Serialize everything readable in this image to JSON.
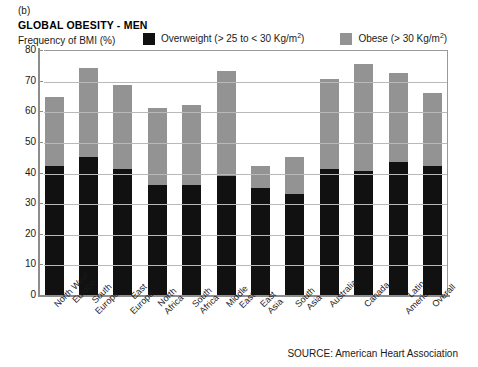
{
  "panel_label": "(b)",
  "title": "GLOBAL OBESITY - MEN",
  "axis_caption": "Frequency of BMI (%)",
  "source": "SOURCE: American Heart Association",
  "legend": [
    {
      "name": "legend-overweight",
      "label_pre": "Overweight (> 25 to < 30 Kg/m",
      "label_sup": "2",
      "label_post": ")",
      "color": "#111111"
    },
    {
      "name": "legend-obese",
      "label_pre": "Obese (> 30 Kg/m",
      "label_sup": "2",
      "label_post": ")",
      "color": "#939393"
    }
  ],
  "chart_data": {
    "type": "bar",
    "subtype": "stacked-vertical",
    "title": "GLOBAL OBESITY - MEN",
    "xlabel": "",
    "ylabel": "Frequency of BMI (%)",
    "ylim": [
      0,
      80
    ],
    "yticks": [
      0,
      10,
      20,
      30,
      40,
      50,
      60,
      70,
      80
    ],
    "grid": true,
    "legend_position": "top",
    "categories": [
      "North West Europe",
      "South Europe",
      "East Europe",
      "North Africa",
      "South Africa",
      "Middle East",
      "East Asia",
      "South Asia",
      "Australia",
      "Canada",
      "Latin America",
      "Overall"
    ],
    "category_lines": [
      [
        "North West",
        "Europe"
      ],
      [
        "South",
        "Europe"
      ],
      [
        "East",
        "Europe"
      ],
      [
        "North",
        "Africa"
      ],
      [
        "South",
        "Africa"
      ],
      [
        "Middle",
        "East"
      ],
      [
        "East",
        "Asia"
      ],
      [
        "South",
        "Asia"
      ],
      [
        "Australia"
      ],
      [
        "Canada"
      ],
      [
        "Latin",
        "America"
      ],
      [
        "Overall"
      ]
    ],
    "series": [
      {
        "name": "Overweight (> 25 to < 30 Kg/m2)",
        "color": "#111111",
        "values": [
          42,
          45,
          41,
          36,
          36,
          39,
          35,
          33,
          41,
          40.5,
          43.5,
          42
        ]
      },
      {
        "name": "Obese (> 30 Kg/m2)",
        "color": "#939393",
        "values": [
          22.5,
          29,
          27.5,
          25,
          26,
          34,
          7,
          12,
          29.5,
          35,
          29,
          24
        ]
      }
    ],
    "totals": [
      64.5,
      74,
      68.5,
      61,
      62,
      73,
      42,
      45,
      70.5,
      75.5,
      72.5,
      66
    ]
  }
}
